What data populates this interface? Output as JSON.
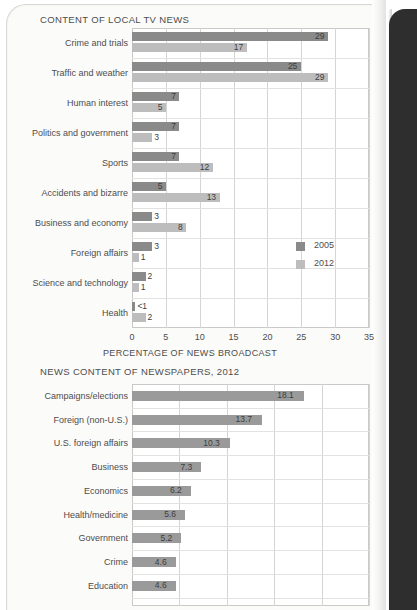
{
  "page": {
    "background_color": "#fbfbfa",
    "binding_color": "#2e2e2e"
  },
  "colors": {
    "series_2005": "#8a8a8a",
    "series_2012": "#bdbdbd",
    "single_series": "#9a9a9a",
    "gridline": "#d5d5d3",
    "text": "#4d4d4d"
  },
  "chart_data": [
    {
      "id": "local-tv-news",
      "type": "bar",
      "orientation": "horizontal",
      "title": "CONTENT OF LOCAL TV NEWS",
      "xlabel": "PERCENTAGE OF NEWS BROADCAST",
      "ylabel": "",
      "xlim": [
        0,
        35
      ],
      "xticks": [
        "0",
        "5",
        "10",
        "15",
        "20",
        "25",
        "30",
        "35"
      ],
      "grid": true,
      "legend_position": "inside-right",
      "categories": [
        "Crime and trials",
        "Traffic and weather",
        "Human interest",
        "Politics and government",
        "Sports",
        "Accidents and bizarre",
        "Business and economy",
        "Foreign affairs",
        "Science and technology",
        "Health"
      ],
      "series": [
        {
          "name": "2005",
          "color": "#8a8a8a",
          "values": [
            29,
            25,
            7,
            7,
            7,
            5,
            3,
            3,
            2,
            0.5
          ],
          "labels": [
            "29",
            "25",
            "7",
            "7",
            "7",
            "5",
            "3",
            "3",
            "2",
            "<1"
          ]
        },
        {
          "name": "2012",
          "color": "#bdbdbd",
          "values": [
            17,
            29,
            5,
            3,
            12,
            13,
            8,
            1,
            1,
            2
          ],
          "labels": [
            "17",
            "29",
            "5",
            "3",
            "12",
            "13",
            "8",
            "1",
            "1",
            "2"
          ]
        }
      ]
    },
    {
      "id": "newspapers-2012",
      "type": "bar",
      "orientation": "horizontal",
      "title": "NEWS CONTENT OF NEWSPAPERS, 2012",
      "xlabel": "",
      "ylabel": "",
      "xlim": [
        0,
        25
      ],
      "xticks": [],
      "grid": true,
      "legend_position": "none",
      "categories": [
        "Campaigns/elections",
        "Foreign (non-U.S.)",
        "U.S. foreign affairs",
        "Business",
        "Economics",
        "Health/medicine",
        "Government",
        "Crime",
        "Education"
      ],
      "series": [
        {
          "name": "2012",
          "color": "#9a9a9a",
          "values": [
            18.1,
            13.7,
            10.3,
            7.3,
            6.2,
            5.6,
            5.2,
            4.6,
            4.6
          ],
          "labels": [
            "18.1",
            "13.7",
            "10.3",
            "7.3",
            "6.2",
            "5.6",
            "5.2",
            "4.6",
            "4.6"
          ]
        }
      ]
    }
  ]
}
